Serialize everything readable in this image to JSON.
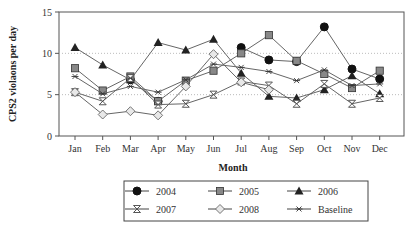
{
  "chart_data": {
    "type": "line",
    "title": "",
    "xlabel": "Month",
    "ylabel": "CPS2 violaons per day",
    "ylim": [
      0,
      15
    ],
    "yticks": [
      0,
      5,
      10,
      15
    ],
    "grid": {
      "y_dotted_at": [
        5,
        10
      ]
    },
    "legend_position": "bottom",
    "categories": [
      "Jan",
      "Feb",
      "Mar",
      "Apr",
      "May",
      "Jun",
      "Jul",
      "Aug",
      "Sep",
      "Oct",
      "Nov",
      "Dec"
    ],
    "series": [
      {
        "name": "2004",
        "marker": "circle-filled",
        "values": [
          null,
          null,
          6.8,
          4.2,
          null,
          null,
          10.7,
          9.2,
          9.0,
          13.2,
          8.1,
          6.9
        ]
      },
      {
        "name": "2005",
        "marker": "square-gray",
        "values": [
          8.2,
          5.5,
          7.2,
          4.2,
          6.7,
          7.9,
          10.0,
          12.2,
          9.1,
          7.5,
          5.8,
          7.9
        ]
      },
      {
        "name": "2006",
        "marker": "triangle-filled",
        "values": [
          10.7,
          8.6,
          6.8,
          11.3,
          10.4,
          11.7,
          7.6,
          4.8,
          4.6,
          5.6,
          7.3,
          5.1
        ]
      },
      {
        "name": "2007",
        "marker": "hourglass",
        "values": [
          5.3,
          4.2,
          7.0,
          3.8,
          3.9,
          5.0,
          6.6,
          6.1,
          3.9,
          6.3,
          3.9,
          4.6
        ]
      },
      {
        "name": "2008",
        "marker": "diamond-open",
        "values": [
          5.3,
          2.6,
          3.0,
          2.5,
          6.0,
          9.9,
          6.5,
          5.6,
          null,
          null,
          null,
          null
        ]
      },
      {
        "name": "Baseline",
        "marker": "asterisk",
        "values": [
          7.2,
          5.1,
          6.0,
          5.3,
          6.8,
          8.7,
          8.3,
          7.8,
          6.7,
          8.0,
          6.1,
          6.3
        ]
      }
    ]
  },
  "legend": {
    "items": [
      "2004",
      "2005",
      "2006",
      "2007",
      "2008",
      "Baseline"
    ]
  }
}
